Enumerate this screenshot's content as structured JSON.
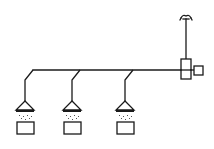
{
  "diagram": {
    "type": "schematic",
    "colors": {
      "line": "#1a1a1a",
      "background": "#ffffff"
    },
    "main_line": {
      "x1": 33,
      "x2": 181,
      "y": 70
    },
    "controller": {
      "x": 181,
      "y": 59,
      "w": 10,
      "h": 20,
      "label": ""
    },
    "side_box": {
      "x": 194,
      "y": 66,
      "w": 10,
      "h": 9
    },
    "antenna": {
      "x": 186,
      "top": 17
    },
    "branches": [
      {
        "id": "branch-1",
        "join_x": 33,
        "drop_x": 25
      },
      {
        "id": "branch-2",
        "join_x": 80,
        "drop_x": 72
      },
      {
        "id": "branch-3",
        "join_x": 133,
        "drop_x": 125
      }
    ]
  }
}
